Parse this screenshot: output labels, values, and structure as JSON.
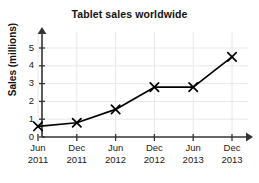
{
  "chart_data": {
    "type": "line",
    "title": "Tablet sales worldwide",
    "xlabel": "",
    "ylabel": "Sales (millions)",
    "categories": [
      "Jun 2011",
      "Dec 2011",
      "Jun 2012",
      "Dec 2012",
      "Jun 2013",
      "Dec 2013"
    ],
    "category_lines": [
      {
        "month": "Jun",
        "year": "2011"
      },
      {
        "month": "Dec",
        "year": "2011"
      },
      {
        "month": "Jun",
        "year": "2012"
      },
      {
        "month": "Dec",
        "year": "2012"
      },
      {
        "month": "Jun",
        "year": "2013"
      },
      {
        "month": "Dec",
        "year": "2013"
      }
    ],
    "values": [
      0.6,
      0.8,
      1.55,
      2.8,
      2.8,
      4.5
    ],
    "ylim": [
      0,
      5.6
    ],
    "yticks": [
      0,
      1,
      2,
      3,
      4,
      5
    ],
    "ytick_labels": [
      "0",
      "1",
      "2",
      "3",
      "4",
      "5"
    ],
    "grid": true,
    "legend": false,
    "marker": "x",
    "line_color": "#000000",
    "grid_color": "#e8e8e8",
    "axis_color": "#333333",
    "text_color": "#111111"
  }
}
